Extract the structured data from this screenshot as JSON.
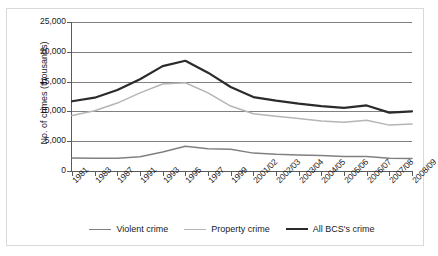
{
  "chart_data": {
    "type": "line",
    "title": "",
    "xlabel": "",
    "ylabel": "No. of crimes (thousands)",
    "ylim": [
      0,
      25000
    ],
    "yticks": [
      0,
      5000,
      10000,
      15000,
      20000,
      25000
    ],
    "ytick_labels": [
      "0",
      "5,000",
      "10,000",
      "15,000",
      "20,000",
      "25,000"
    ],
    "grid": true,
    "legend_position": "bottom",
    "categories": [
      "1981",
      "1983",
      "1987",
      "1991",
      "1993",
      "1995",
      "1997",
      "1999",
      "2001/02",
      "2002/03",
      "2003/04",
      "2004/05",
      "2005/06",
      "2006/07",
      "2007/08",
      "2008/09"
    ],
    "series": [
      {
        "name": "Violent crime",
        "color": "#808080",
        "values": [
          2200,
          2150,
          2150,
          2400,
          3200,
          4150,
          3750,
          3650,
          3000,
          2800,
          2700,
          2600,
          2450,
          2450,
          2150,
          2100
        ]
      },
      {
        "name": "Property crime",
        "color": "#b5b5b5",
        "values": [
          9300,
          10100,
          11400,
          13100,
          14600,
          14800,
          13100,
          10900,
          9600,
          9200,
          8800,
          8400,
          8200,
          8500,
          7700,
          7900
        ]
      },
      {
        "name": "All BCS's crime",
        "color": "#2b2b2b",
        "values": [
          11700,
          12300,
          13600,
          15400,
          17600,
          18500,
          16500,
          14100,
          12400,
          11800,
          11300,
          10900,
          10600,
          11000,
          9800,
          10000
        ]
      }
    ]
  },
  "legend": {
    "items": [
      {
        "label": "Violent crime",
        "color": "#808080",
        "width": 1.6
      },
      {
        "label": "Property crime",
        "color": "#b5b5b5",
        "width": 1.6
      },
      {
        "label": "All BCS's crime",
        "color": "#2b2b2b",
        "width": 2.4
      }
    ]
  },
  "caption": ""
}
